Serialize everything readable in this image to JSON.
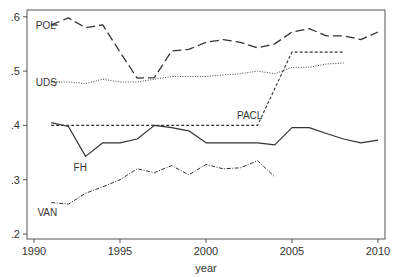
{
  "chart_data": {
    "type": "line",
    "title": "",
    "xlabel": "year",
    "ylabel": "",
    "xlim": [
      1990,
      2010
    ],
    "ylim": [
      0.2,
      0.6
    ],
    "grid": false,
    "legend_position": "inline labels",
    "x_ticks": [
      {
        "value": 1990,
        "label": "1990"
      },
      {
        "value": 1995,
        "label": "1995"
      },
      {
        "value": 2000,
        "label": "2000"
      },
      {
        "value": 2005,
        "label": "2005"
      },
      {
        "value": 2010,
        "label": "2010"
      }
    ],
    "y_ticks": [
      {
        "value": 0.2,
        "label": ".2"
      },
      {
        "value": 0.3,
        "label": ".3"
      },
      {
        "value": 0.4,
        "label": ".4"
      },
      {
        "value": 0.5,
        "label": ".5"
      },
      {
        "value": 0.6,
        "label": ".6"
      }
    ],
    "series": [
      {
        "name": "POL",
        "style": "longdash",
        "label_pos": {
          "x": 1990.1,
          "y": 0.585
        },
        "x": [
          1991,
          1992,
          1993,
          1994,
          1995,
          1996,
          1997,
          1998,
          1999,
          2000,
          2001,
          2002,
          2003,
          2004,
          2005,
          2006,
          2007,
          2008,
          2009,
          2010
        ],
        "values": [
          0.585,
          0.598,
          0.58,
          0.585,
          0.535,
          0.487,
          0.488,
          0.537,
          0.54,
          0.553,
          0.558,
          0.553,
          0.543,
          0.55,
          0.572,
          0.578,
          0.565,
          0.565,
          0.558,
          0.572
        ]
      },
      {
        "name": "UDS",
        "style": "dot",
        "label_pos": {
          "x": 1990.1,
          "y": 0.48
        },
        "x": [
          1991,
          1992,
          1993,
          1994,
          1995,
          1996,
          1997,
          1998,
          1999,
          2000,
          2001,
          2002,
          2003,
          2004,
          2005,
          2006,
          2007,
          2008
        ],
        "values": [
          0.48,
          0.48,
          0.477,
          0.485,
          0.48,
          0.48,
          0.485,
          0.49,
          0.49,
          0.49,
          0.493,
          0.495,
          0.5,
          0.495,
          0.507,
          0.507,
          0.513,
          0.515
        ]
      },
      {
        "name": "PACL",
        "style": "shortdash",
        "label_pos": {
          "x": 2001.8,
          "y": 0.42
        },
        "x": [
          1991,
          1992,
          1993,
          1994,
          1995,
          1996,
          1997,
          1998,
          1999,
          2000,
          2001,
          2002,
          2003,
          2004,
          2005,
          2006,
          2007,
          2008
        ],
        "values": [
          0.4,
          0.4,
          0.4,
          0.4,
          0.4,
          0.4,
          0.4,
          0.4,
          0.4,
          0.4,
          0.4,
          0.4,
          0.4,
          0.468,
          0.535,
          0.535,
          0.535,
          0.535
        ]
      },
      {
        "name": "FH",
        "style": "solid",
        "label_pos": {
          "x": 1992.3,
          "y": 0.323
        },
        "x": [
          1991,
          1992,
          1993,
          1994,
          1995,
          1996,
          1997,
          1998,
          1999,
          2000,
          2001,
          2002,
          2003,
          2004,
          2005,
          2006,
          2007,
          2008,
          2009,
          2010
        ],
        "values": [
          0.405,
          0.398,
          0.343,
          0.368,
          0.368,
          0.375,
          0.4,
          0.396,
          0.39,
          0.368,
          0.368,
          0.368,
          0.368,
          0.364,
          0.396,
          0.396,
          0.385,
          0.375,
          0.368,
          0.373
        ]
      },
      {
        "name": "VAN",
        "style": "dashdot",
        "label_pos": {
          "x": 1990.2,
          "y": 0.24
        },
        "x": [
          1991,
          1992,
          1993,
          1994,
          1995,
          1996,
          1997,
          1998,
          1999,
          2000,
          2001,
          2002,
          2003,
          2004
        ],
        "values": [
          0.258,
          0.255,
          0.275,
          0.287,
          0.3,
          0.32,
          0.313,
          0.326,
          0.309,
          0.328,
          0.32,
          0.322,
          0.335,
          0.305
        ]
      }
    ]
  },
  "colors": {
    "axis": "#555555",
    "line": "#333333",
    "text": "#333333"
  }
}
